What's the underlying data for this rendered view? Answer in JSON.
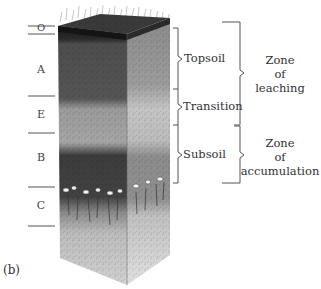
{
  "figure": {
    "panel_label": "(b)"
  },
  "horizons": [
    {
      "label": "O",
      "name": "organic"
    },
    {
      "label": "A",
      "name": "topsoil"
    },
    {
      "label": "E",
      "name": "eluviation"
    },
    {
      "label": "B",
      "name": "subsoil"
    },
    {
      "label": "C",
      "name": "parent material"
    }
  ],
  "layers": [
    {
      "label": "Topsoil"
    },
    {
      "label": "Transition"
    },
    {
      "label": "Subsoil"
    }
  ],
  "zones": [
    {
      "line1": "Zone",
      "line2": "of",
      "line3": "leaching"
    },
    {
      "line1": "Zone",
      "line2": "of",
      "line3": "accumulation"
    }
  ],
  "colors": {
    "O_horizon": "#1c1c1c",
    "A_horizon": "#4a4a4a",
    "E_horizon": "#a9a9a9",
    "B_horizon": "#3d3d3d",
    "C_horizon": "#c8c8c8",
    "bracket": "#555555"
  }
}
